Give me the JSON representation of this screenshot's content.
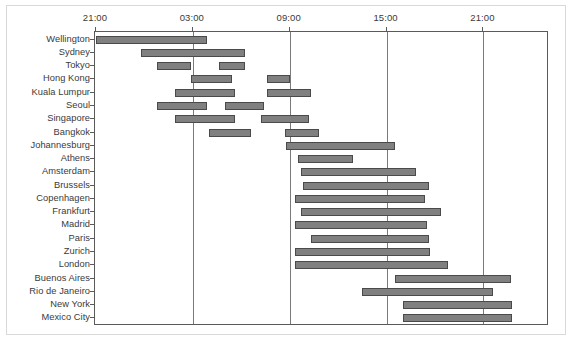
{
  "chart_data": {
    "type": "bar",
    "orientation": "horizontal",
    "subtype": "gantt-range",
    "title": "",
    "subtitle": "",
    "xlabel": "",
    "ylabel": "",
    "grid": true,
    "legend": null,
    "x_axis": {
      "position": "top",
      "label_format": "HH:MM",
      "start_hour": 21,
      "range_hours": 28,
      "xlim": [
        "21:00",
        "01:00"
      ],
      "tick_labels": [
        "21:00",
        "03:00",
        "09:00",
        "15:00",
        "21:00"
      ],
      "tick_hours": [
        0,
        6,
        12,
        18,
        24
      ]
    },
    "bar_color": "#808080",
    "bar_edge_color": "#4a4a4a",
    "categories": [
      "Wellington",
      "Sydney",
      "Tokyo",
      "Hong Kong",
      "Kuala Lumpur",
      "Seoul",
      "Singapore",
      "Bangkok",
      "Johannesburg",
      "Athens",
      "Amsterdam",
      "Brussels",
      "Copenhagen",
      "Frankfurt",
      "Madrid",
      "Paris",
      "Zurich",
      "London",
      "Buenos Aires",
      "Rio de Janeiro",
      "New York",
      "Mexico City"
    ],
    "series": [
      {
        "name": "Wellington",
        "intervals": [
          {
            "start_hour": 0.0,
            "end_hour": 6.9
          }
        ]
      },
      {
        "name": "Sydney",
        "intervals": [
          {
            "start_hour": 2.8,
            "end_hour": 9.2
          }
        ]
      },
      {
        "name": "Tokyo",
        "intervals": [
          {
            "start_hour": 3.8,
            "end_hour": 5.9
          },
          {
            "start_hour": 7.6,
            "end_hour": 9.2
          }
        ]
      },
      {
        "name": "Hong Kong",
        "intervals": [
          {
            "start_hour": 5.9,
            "end_hour": 8.4
          },
          {
            "start_hour": 10.6,
            "end_hour": 12.0
          }
        ]
      },
      {
        "name": "Kuala Lumpur",
        "intervals": [
          {
            "start_hour": 4.9,
            "end_hour": 8.6
          },
          {
            "start_hour": 10.6,
            "end_hour": 13.3
          }
        ]
      },
      {
        "name": "Seoul",
        "intervals": [
          {
            "start_hour": 3.8,
            "end_hour": 6.9
          },
          {
            "start_hour": 8.0,
            "end_hour": 10.4
          }
        ]
      },
      {
        "name": "Singapore",
        "intervals": [
          {
            "start_hour": 4.9,
            "end_hour": 8.6
          },
          {
            "start_hour": 10.2,
            "end_hour": 13.2
          }
        ]
      },
      {
        "name": "Bangkok",
        "intervals": [
          {
            "start_hour": 7.0,
            "end_hour": 9.6
          },
          {
            "start_hour": 11.7,
            "end_hour": 13.8
          }
        ]
      },
      {
        "name": "Johannesburg",
        "intervals": [
          {
            "start_hour": 11.8,
            "end_hour": 18.5
          }
        ]
      },
      {
        "name": "Athens",
        "intervals": [
          {
            "start_hour": 12.5,
            "end_hour": 15.9
          }
        ]
      },
      {
        "name": "Amsterdam",
        "intervals": [
          {
            "start_hour": 12.7,
            "end_hour": 19.8
          }
        ]
      },
      {
        "name": "Brussels",
        "intervals": [
          {
            "start_hour": 12.8,
            "end_hour": 20.6
          }
        ]
      },
      {
        "name": "Copenhagen",
        "intervals": [
          {
            "start_hour": 12.3,
            "end_hour": 20.4
          }
        ]
      },
      {
        "name": "Frankfurt",
        "intervals": [
          {
            "start_hour": 12.7,
            "end_hour": 21.4
          }
        ]
      },
      {
        "name": "Madrid",
        "intervals": [
          {
            "start_hour": 12.3,
            "end_hour": 20.5
          }
        ]
      },
      {
        "name": "Paris",
        "intervals": [
          {
            "start_hour": 13.3,
            "end_hour": 20.6
          }
        ]
      },
      {
        "name": "Zurich",
        "intervals": [
          {
            "start_hour": 12.3,
            "end_hour": 20.7
          }
        ]
      },
      {
        "name": "London",
        "intervals": [
          {
            "start_hour": 12.3,
            "end_hour": 21.8
          }
        ]
      },
      {
        "name": "Buenos Aires",
        "intervals": [
          {
            "start_hour": 18.5,
            "end_hour": 25.7
          }
        ]
      },
      {
        "name": "Rio de Janeiro",
        "intervals": [
          {
            "start_hour": 16.5,
            "end_hour": 24.6
          }
        ]
      },
      {
        "name": "New York",
        "intervals": [
          {
            "start_hour": 19.0,
            "end_hour": 25.8
          }
        ]
      },
      {
        "name": "Mexico City",
        "intervals": [
          {
            "start_hour": 19.0,
            "end_hour": 25.8
          }
        ]
      }
    ]
  }
}
